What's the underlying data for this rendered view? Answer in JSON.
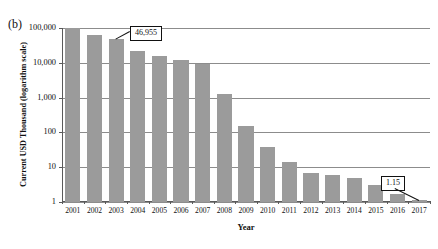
{
  "figure": {
    "panel_letter": "(b)"
  },
  "chart_data": {
    "type": "bar",
    "title": "",
    "xlabel": "Year",
    "ylabel": "Current USD Thousand (logarithm scale)",
    "yscale": "log",
    "ylim": [
      1,
      100000
    ],
    "grid": true,
    "legend": null,
    "ytick_labels": [
      "100,000",
      "10,000",
      "1,000",
      "100",
      "10",
      "1"
    ],
    "ytick_values": [
      100000,
      10000,
      1000,
      100,
      10,
      1
    ],
    "categories": [
      "2001",
      "2002",
      "2003",
      "2004",
      "2005",
      "2006",
      "2007",
      "2008",
      "2009",
      "2010",
      "2011",
      "2012",
      "2013",
      "2014",
      "2015",
      "2016",
      "2017"
    ],
    "values": [
      100000,
      65000,
      46955,
      22000,
      16000,
      12000,
      9000,
      1300,
      150,
      38,
      14,
      7,
      6,
      5,
      3,
      1.7,
      1.15
    ],
    "bar_color": "#9b9b9b",
    "annotations": [
      {
        "label": "46,955",
        "category": "2003",
        "value": 46955
      },
      {
        "label": "1.15",
        "category": "2017",
        "value": 1.15
      }
    ]
  }
}
